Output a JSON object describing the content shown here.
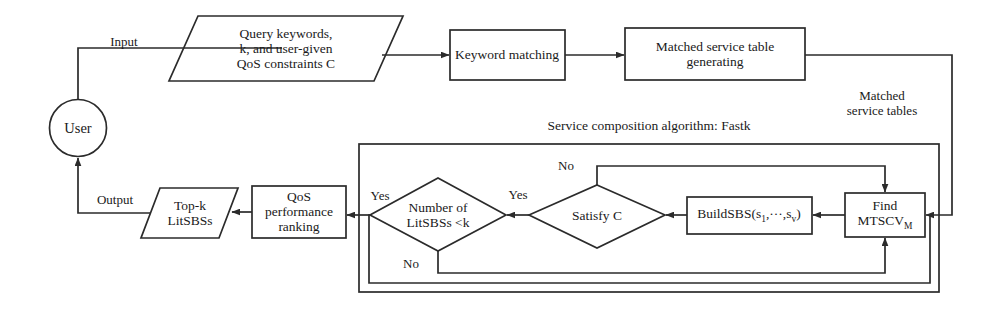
{
  "diagram": {
    "stroke_color": "#2b2b2b",
    "background_color": "#ffffff"
  },
  "nodes": {
    "user": {
      "label": "User",
      "shape": "circle"
    },
    "query_input": {
      "line1": "Query keywords,",
      "line2": "k, and user-given",
      "line3": "QoS constraints C",
      "shape": "parallelogram"
    },
    "keyword_matching": {
      "label": "Keyword  matching",
      "shape": "rectangle"
    },
    "matched_table_generating": {
      "line1": "Matched service table",
      "line2": "generating",
      "shape": "rectangle"
    },
    "find_mtscv": {
      "line1": "Find",
      "line2": "MTSCV",
      "sub2": "M",
      "shape": "rectangle"
    },
    "build_sbs": {
      "prefix": "BuildSBS(s",
      "sub1": "1",
      "mid": ",···,s",
      "sub2": "v",
      "suffix": ")",
      "shape": "rectangle"
    },
    "satisfy_c": {
      "label": "Satisfy C",
      "shape": "diamond"
    },
    "number_litsbss": {
      "line1": "Number of",
      "line2": "LitSBSs <k",
      "shape": "diamond"
    },
    "qos_ranking": {
      "line1": "QoS",
      "line2": "performance",
      "line3": "ranking",
      "shape": "rectangle"
    },
    "topk_output": {
      "line1": "Top-k",
      "line2": "LitSBSs",
      "shape": "parallelogram"
    }
  },
  "container": {
    "title": "Service composition algorithm: Fastk"
  },
  "edge_labels": {
    "input": "Input",
    "output": "Output",
    "matched_service_tables_l1": "Matched",
    "matched_service_tables_l2": "service tables",
    "satisfy_no": "No",
    "satisfy_yes": "Yes",
    "count_yes": "Yes",
    "count_no": "No"
  }
}
